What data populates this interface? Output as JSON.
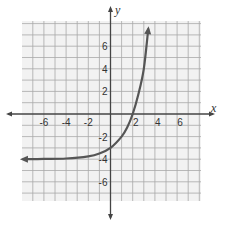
{
  "chart_data": {
    "type": "line",
    "title": "",
    "xlabel": "x",
    "ylabel": "y",
    "xlim": [
      -8,
      8
    ],
    "ylim": [
      -8,
      8
    ],
    "grid": true,
    "x_ticks": [
      -6,
      -4,
      -2,
      2,
      4,
      6
    ],
    "y_ticks": [
      6,
      4,
      2,
      -2,
      -4,
      -6
    ],
    "x_tick_labels": [
      "-6",
      "-4",
      "-2",
      "2",
      "4",
      "6"
    ],
    "y_tick_labels": [
      "6",
      "4",
      "2",
      "-2",
      "-4",
      "-6"
    ],
    "series": [
      {
        "name": "exponential curve",
        "description": "Exponential growth curve with horizontal asymptote y = -4, passing through (0,-3) and x-intercept near x = 2; arrows at both ends",
        "asymptote": -4,
        "x": [
          -7.8,
          -6,
          -4,
          -2,
          -1,
          0,
          1,
          1.5,
          2,
          2.5,
          3,
          3.4
        ],
        "y": [
          -4.0,
          -3.98,
          -3.94,
          -3.75,
          -3.5,
          -3.0,
          -2.0,
          -1.2,
          0.0,
          1.7,
          4.0,
          7.5
        ],
        "color": "#555555"
      }
    ],
    "colors": {
      "grid": "#a8a8a8",
      "grid_background": "#f2f2f2",
      "axis": "#444444",
      "curve": "#555555"
    }
  }
}
